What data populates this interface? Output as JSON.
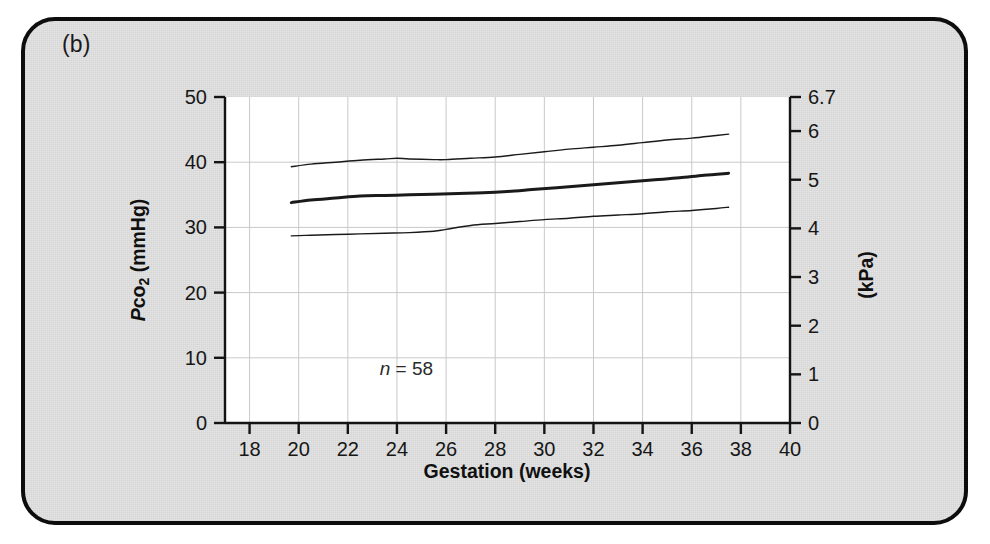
{
  "figure": {
    "panel_label": "(b)",
    "background_color": "#e4e4e4",
    "border_color": "#0d0d0d",
    "plot_background_color": "#ffffff"
  },
  "chart_data": {
    "type": "line",
    "title": "",
    "subtitle": "",
    "panel": "(b)",
    "xlabel": "Gestation (weeks)",
    "ylabel": "Pco2 (mmHg)",
    "ylabel_parts": {
      "italic": "P",
      "subscript_base": "co",
      "subscript": "2",
      "units": " (mmHg)"
    },
    "y2label": "(kPa)",
    "xlim": [
      17,
      40
    ],
    "ylim": [
      0,
      50
    ],
    "y2lim": [
      0,
      6.7
    ],
    "xticks": [
      18,
      20,
      22,
      24,
      26,
      28,
      30,
      32,
      34,
      36,
      38,
      40
    ],
    "xtick_labels": [
      "18",
      "20",
      "22",
      "24",
      "26",
      "28",
      "30",
      "32",
      "34",
      "36",
      "38",
      "40"
    ],
    "yticks": [
      0,
      10,
      20,
      30,
      40,
      50
    ],
    "ytick_labels": [
      "0",
      "10",
      "20",
      "30",
      "40",
      "50"
    ],
    "y2ticks": [
      0,
      1,
      2,
      3,
      4,
      5,
      6,
      6.7
    ],
    "y2tick_labels": [
      "0",
      "1",
      "2",
      "3",
      "4",
      "5",
      "6",
      "6.7"
    ],
    "grid": true,
    "grid_color": "#c9c9c9",
    "legend": "none",
    "annotations": [
      {
        "text": "n = 58",
        "italic_prefix": "n",
        "rest": " = 58",
        "x": 23.3,
        "y": 7.4
      }
    ],
    "line_color": "#1a1a1a",
    "series": [
      {
        "name": "upper limit (97.5th centile)",
        "style": "thin",
        "width": 1.4,
        "x": [
          19.7,
          20.5,
          21.5,
          22.5,
          23.5,
          24.0,
          24.5,
          25.5,
          26.0,
          27.0,
          28.0,
          29.0,
          30.0,
          31.0,
          32.0,
          33.0,
          34.0,
          35.0,
          36.0,
          37.0,
          37.5
        ],
        "y": [
          39.3,
          39.7,
          40.0,
          40.3,
          40.5,
          40.6,
          40.5,
          40.4,
          40.4,
          40.6,
          40.8,
          41.2,
          41.6,
          42.0,
          42.3,
          42.6,
          43.0,
          43.4,
          43.7,
          44.1,
          44.3
        ]
      },
      {
        "name": "mean",
        "style": "thick",
        "width": 3.0,
        "x": [
          19.7,
          20.5,
          21.5,
          22.5,
          23.5,
          24.5,
          25.5,
          26.5,
          27.5,
          28.5,
          29.5,
          30.5,
          31.5,
          32.5,
          33.5,
          34.5,
          35.5,
          36.5,
          37.5
        ],
        "y": [
          33.8,
          34.2,
          34.5,
          34.8,
          34.9,
          35.0,
          35.1,
          35.2,
          35.3,
          35.5,
          35.8,
          36.1,
          36.4,
          36.7,
          37.0,
          37.3,
          37.6,
          38.0,
          38.3
        ]
      },
      {
        "name": "lower limit (2.5th centile)",
        "style": "thin",
        "width": 1.4,
        "x": [
          19.7,
          20.5,
          21.5,
          22.5,
          23.5,
          24.5,
          25.5,
          26.0,
          27.0,
          28.0,
          29.0,
          30.0,
          31.0,
          32.0,
          33.0,
          34.0,
          35.0,
          36.0,
          37.0,
          37.5
        ],
        "y": [
          28.7,
          28.8,
          28.9,
          29.0,
          29.1,
          29.2,
          29.4,
          29.7,
          30.3,
          30.6,
          30.9,
          31.2,
          31.4,
          31.7,
          31.9,
          32.1,
          32.4,
          32.6,
          32.9,
          33.1
        ]
      }
    ]
  }
}
